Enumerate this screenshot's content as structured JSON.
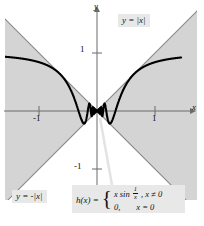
{
  "chart_data": {
    "type": "line",
    "title": "",
    "xlabel": "x",
    "ylabel": "y",
    "xlim": [
      -1.6,
      1.45
    ],
    "ylim": [
      -1.75,
      1.9
    ],
    "grid": false,
    "legend_position": "in-plot",
    "x_ticks": [
      -1,
      1
    ],
    "x_tick_labels": [
      "-1",
      "1"
    ],
    "y_ticks": [
      1,
      -1
    ],
    "y_tick_labels": [
      "1",
      "-1"
    ],
    "series": [
      {
        "name": "y = |x|",
        "formula": "abs(x)",
        "style": "solid-thin-gray",
        "color": "#808080",
        "description": "upper envelope boundary of shaded region"
      },
      {
        "name": "y = -|x|",
        "formula": "-abs(x)",
        "style": "solid-thin-gray",
        "color": "#808080",
        "description": "lower envelope boundary of shaded region"
      },
      {
        "name": "h(x)",
        "formula": "x*sin(1/x)",
        "style": "solid-thick-black",
        "color": "#000000",
        "description": "oscillating curve squeezed between y=|x| and y=-|x|"
      }
    ],
    "shaded_region": {
      "label": "region between y = -|x| and y = |x|",
      "color": "#d4d4d4"
    },
    "annotations": [
      {
        "id": "label-yabs",
        "text": "y = |x|"
      },
      {
        "id": "label-ynegabs",
        "text": "y = -|x|"
      },
      {
        "id": "formula",
        "text": "h(x) = { x sin 1/x, x != 0 ; 0, x = 0 }"
      }
    ]
  },
  "labels": {
    "y_abs": "y = |x|",
    "y_neg_abs": "y = -|x|",
    "axis_x": "x",
    "axis_y": "y",
    "tick_x_neg1": "-1",
    "tick_x_pos1": "1",
    "tick_y_pos1": "1",
    "tick_y_neg1": "-1"
  },
  "formula": {
    "head": "h(x) =",
    "case1_expr_a": "x sin",
    "frac_num": "1",
    "frac_den": "x",
    "case1_cond": ", x ≠ 0",
    "case2_expr": "0,",
    "case2_cond": "x = 0"
  },
  "colors": {
    "shade": "#d4d4d4",
    "curve": "#000000",
    "envelope": "#808080",
    "axis": "#6b6b6b",
    "label_box": "#e8e8e8"
  }
}
